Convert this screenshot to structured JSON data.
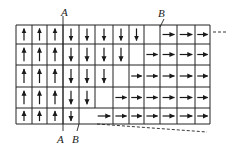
{
  "diagram": {
    "colors": {
      "line": "#222222",
      "arrow": "#1a1a1a",
      "background": "#ffffff"
    },
    "grid": {
      "col_x": [
        16,
        32,
        47,
        63,
        79,
        95,
        113,
        129,
        144,
        160,
        177,
        195,
        210
      ],
      "row_y": [
        25,
        44,
        65,
        87,
        108,
        124
      ],
      "rows": [
        [
          "up",
          "up",
          "up",
          "down",
          "down",
          "down",
          "down",
          "down",
          "empty",
          "right",
          "right",
          "right"
        ],
        [
          "up",
          "up",
          "up",
          "down",
          "down",
          "down",
          "down",
          "empty",
          "right",
          "right",
          "right",
          "right"
        ],
        [
          "up",
          "up",
          "up",
          "down",
          "down",
          "down",
          "empty",
          "right",
          "right",
          "right",
          "right",
          "right"
        ],
        [
          "up",
          "up",
          "up",
          "down",
          "down",
          "empty",
          "right",
          "right",
          "right",
          "right",
          "right",
          "right"
        ],
        [
          "up",
          "up",
          "up",
          "down",
          "empty",
          "right",
          "right",
          "right",
          "right",
          "right",
          "right",
          "right"
        ]
      ],
      "merged_no_divider": [
        {
          "row": 4,
          "between_cols": [
            4,
            5
          ]
        }
      ]
    },
    "labels": {
      "top_a": "A",
      "top_b": "B",
      "bottom_a": "A",
      "bottom_b": "B"
    },
    "lines": {
      "a_line": {
        "x1": 63,
        "y1": 16,
        "x2": 63,
        "y2": 131
      },
      "b_top": {
        "x1": 164,
        "y1": 19,
        "x2": 160,
        "y2": 27
      },
      "b_bottom": {
        "x1": 79,
        "y1": 124,
        "x2": 77,
        "y2": 131
      },
      "dash_right": {
        "x1": 213,
        "y1": 32,
        "x2": 226,
        "y2": 32
      },
      "dash_bottom": {
        "x1": 97,
        "y1": 124,
        "x2": 207,
        "y2": 132
      }
    }
  }
}
